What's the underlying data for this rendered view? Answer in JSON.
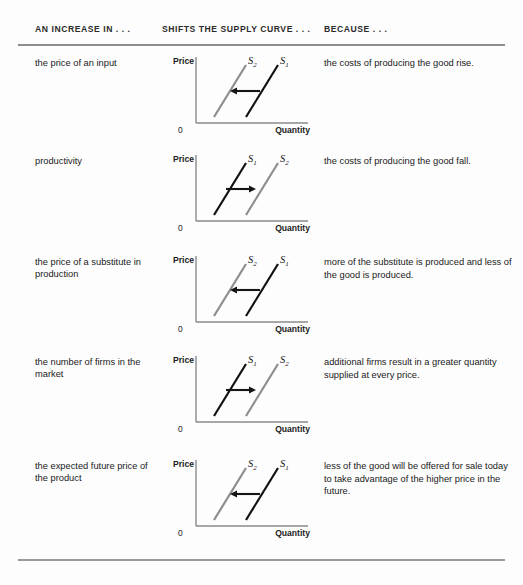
{
  "table": {
    "headers": {
      "cause": "AN INCREASE IN . . .",
      "effect": "SHIFTS THE SUPPLY CURVE . . .",
      "reason": "BECAUSE . . ."
    },
    "colors": {
      "curve_s1": "#111111",
      "curve_s2": "#8d8d8d",
      "axis": "#8a8a8a",
      "arrow": "#151515",
      "rule": "#8e8e8e"
    },
    "rows": [
      {
        "cause": "the price of an input",
        "reason": "the costs of producing the good rise.",
        "chart": {
          "axis_y_label": "Price",
          "axis_x_label": "Quantity",
          "origin_label": "0",
          "shift_direction": "left",
          "left_curve_label": "S",
          "left_curve_sub": "2",
          "right_curve_label": "S",
          "right_curve_sub": "1",
          "left_curve_color": "#8d8d8d",
          "right_curve_color": "#111111"
        }
      },
      {
        "cause": "productivity",
        "reason": "the costs of producing the good fall.",
        "chart": {
          "axis_y_label": "Price",
          "axis_x_label": "Quantity",
          "origin_label": "0",
          "shift_direction": "right",
          "left_curve_label": "S",
          "left_curve_sub": "1",
          "right_curve_label": "S",
          "right_curve_sub": "2",
          "left_curve_color": "#111111",
          "right_curve_color": "#8d8d8d"
        }
      },
      {
        "cause": "the price of a substitute in production",
        "reason": "more of the substitute is produced and less of the good is produced.",
        "chart": {
          "axis_y_label": "Price",
          "axis_x_label": "Quantity",
          "origin_label": "0",
          "shift_direction": "left",
          "left_curve_label": "S",
          "left_curve_sub": "2",
          "right_curve_label": "S",
          "right_curve_sub": "1",
          "left_curve_color": "#8d8d8d",
          "right_curve_color": "#111111"
        }
      },
      {
        "cause": "the number of firms in the market",
        "reason": "additional firms result in a greater quantity supplied at every price.",
        "chart": {
          "axis_y_label": "Price",
          "axis_x_label": "Quantity",
          "origin_label": "0",
          "shift_direction": "right",
          "left_curve_label": "S",
          "left_curve_sub": "1",
          "right_curve_label": "S",
          "right_curve_sub": "2",
          "left_curve_color": "#111111",
          "right_curve_color": "#8d8d8d"
        }
      },
      {
        "cause": "the expected future price of the product",
        "reason": "less of the good will be offered for sale today to take advantage of the higher price in the future.",
        "chart": {
          "axis_y_label": "Price",
          "axis_x_label": "Quantity",
          "origin_label": "0",
          "shift_direction": "left",
          "left_curve_label": "S",
          "left_curve_sub": "2",
          "right_curve_label": "S",
          "right_curve_sub": "1",
          "left_curve_color": "#8d8d8d",
          "right_curve_color": "#111111"
        }
      }
    ]
  },
  "chart_data": {
    "type": "line",
    "xlabel": "Quantity",
    "ylabel": "Price",
    "xlim": [
      0,
      10
    ],
    "ylim": [
      0,
      10
    ],
    "grid": false,
    "legend": "inline-labels",
    "panels": [
      {
        "panel": 1,
        "cause": "the price of an input",
        "shift": "left",
        "series": [
          {
            "name": "S1",
            "color": "#111111",
            "x": [
              4.2,
              8.0
            ],
            "y": [
              1.5,
              8.2
            ]
          },
          {
            "name": "S2",
            "color": "#8d8d8d",
            "x": [
              1.4,
              5.2
            ],
            "y": [
              1.5,
              8.2
            ]
          }
        ],
        "annotation": {
          "arrow_from_x": 6.2,
          "arrow_to_x": 4.0,
          "arrow_y": 4.8
        }
      },
      {
        "panel": 2,
        "cause": "productivity",
        "shift": "right",
        "series": [
          {
            "name": "S1",
            "color": "#111111",
            "x": [
              1.4,
              5.2
            ],
            "y": [
              1.5,
              8.2
            ]
          },
          {
            "name": "S2",
            "color": "#8d8d8d",
            "x": [
              4.2,
              8.0
            ],
            "y": [
              1.5,
              8.2
            ]
          }
        ],
        "annotation": {
          "arrow_from_x": 3.2,
          "arrow_to_x": 5.4,
          "arrow_y": 4.8
        }
      },
      {
        "panel": 3,
        "cause": "the price of a substitute in production",
        "shift": "left",
        "series": [
          {
            "name": "S1",
            "color": "#111111",
            "x": [
              4.2,
              8.0
            ],
            "y": [
              1.5,
              8.2
            ]
          },
          {
            "name": "S2",
            "color": "#8d8d8d",
            "x": [
              1.4,
              5.2
            ],
            "y": [
              1.5,
              8.2
            ]
          }
        ],
        "annotation": {
          "arrow_from_x": 6.2,
          "arrow_to_x": 4.0,
          "arrow_y": 4.8
        }
      },
      {
        "panel": 4,
        "cause": "the number of firms in the market",
        "shift": "right",
        "series": [
          {
            "name": "S1",
            "color": "#111111",
            "x": [
              1.4,
              5.2
            ],
            "y": [
              1.5,
              8.2
            ]
          },
          {
            "name": "S2",
            "color": "#8d8d8d",
            "x": [
              4.2,
              8.0
            ],
            "y": [
              1.5,
              8.2
            ]
          }
        ],
        "annotation": {
          "arrow_from_x": 3.2,
          "arrow_to_x": 5.4,
          "arrow_y": 4.8
        }
      },
      {
        "panel": 5,
        "cause": "the expected future price of the product",
        "shift": "left",
        "series": [
          {
            "name": "S1",
            "color": "#111111",
            "x": [
              4.2,
              8.0
            ],
            "y": [
              1.5,
              8.2
            ]
          },
          {
            "name": "S2",
            "color": "#8d8d8d",
            "x": [
              1.4,
              5.2
            ],
            "y": [
              1.5,
              8.2
            ]
          }
        ],
        "annotation": {
          "arrow_from_x": 6.2,
          "arrow_to_x": 4.0,
          "arrow_y": 4.8
        }
      }
    ]
  }
}
